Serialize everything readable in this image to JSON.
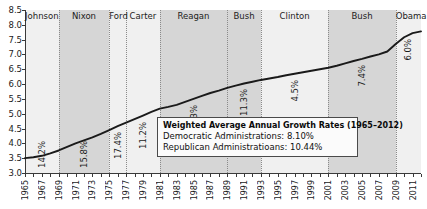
{
  "chart_data": {
    "type": "line",
    "title": "",
    "xlabel": "",
    "ylabel": "",
    "xlim": [
      1965,
      2012
    ],
    "ylim": [
      3.0,
      8.5
    ],
    "grid": false,
    "legend_position": "inside-center-right",
    "y_ticks": [
      "8.5",
      "8.0",
      "7.5",
      "7.0",
      "6.5",
      "6.0",
      "5.5",
      "5.0",
      "4.5",
      "4.0",
      "3.5",
      "3.0"
    ],
    "x_ticks": [
      "1965",
      "1967",
      "1969",
      "1971",
      "1973",
      "1975",
      "1977",
      "1979",
      "1981",
      "1983",
      "1985",
      "1987",
      "1989",
      "1991",
      "1993",
      "1995",
      "1997",
      "1999",
      "2001",
      "2003",
      "2005",
      "2007",
      "2009",
      "2011"
    ],
    "x": [
      1965,
      1966,
      1967,
      1968,
      1969,
      1970,
      1971,
      1972,
      1973,
      1974,
      1975,
      1976,
      1977,
      1978,
      1979,
      1980,
      1981,
      1982,
      1983,
      1984,
      1985,
      1986,
      1987,
      1988,
      1989,
      1990,
      1991,
      1992,
      1993,
      1994,
      1995,
      1996,
      1997,
      1998,
      1999,
      2000,
      2001,
      2002,
      2003,
      2004,
      2005,
      2006,
      2007,
      2008,
      2009,
      2010,
      2011,
      2012
    ],
    "values": [
      3.5,
      3.53,
      3.58,
      3.66,
      3.76,
      3.88,
      4.0,
      4.1,
      4.2,
      4.32,
      4.45,
      4.58,
      4.7,
      4.82,
      4.94,
      5.06,
      5.17,
      5.23,
      5.3,
      5.4,
      5.5,
      5.6,
      5.7,
      5.78,
      5.87,
      5.95,
      6.02,
      6.08,
      6.14,
      6.19,
      6.24,
      6.3,
      6.35,
      6.4,
      6.45,
      6.5,
      6.55,
      6.62,
      6.7,
      6.78,
      6.85,
      6.93,
      7.0,
      7.1,
      7.35,
      7.58,
      7.72,
      7.78
    ],
    "series_name": "Cumulative debt (log scale)",
    "eras": [
      {
        "name": "Johnson",
        "start": 1965,
        "end": 1969,
        "shade": "light",
        "rate": "14.2%"
      },
      {
        "name": "Nixon",
        "start": 1969,
        "end": 1975,
        "shade": "dark",
        "rate": "15.8%"
      },
      {
        "name": "Ford",
        "start": 1975,
        "end": 1977,
        "shade": "light",
        "rate": "17.4%"
      },
      {
        "name": "Carter",
        "start": 1977,
        "end": 1981,
        "shade": "light",
        "rate": "11.2%"
      },
      {
        "name": "Reagan",
        "start": 1981,
        "end": 1989,
        "shade": "dark",
        "rate": "7.3%"
      },
      {
        "name": "Bush",
        "start": 1989,
        "end": 1993,
        "shade": "dark",
        "rate": "11.3%"
      },
      {
        "name": "Clinton",
        "start": 1993,
        "end": 2001,
        "shade": "light",
        "rate": "4.5%"
      },
      {
        "name": "Bush",
        "start": 2001,
        "end": 2009,
        "shade": "dark",
        "rate": "7.4%"
      },
      {
        "name": "Obama",
        "start": 2009,
        "end": 2012,
        "shade": "light",
        "rate": "6.0%"
      }
    ],
    "annotation": {
      "title": "Weighted Average Annual Growth Rates (1965–2012)",
      "rows": [
        "Democratic Administrations: 8.10%",
        "Republican Administratioans: 10.44%"
      ]
    },
    "colors": {
      "line": "#1a1a1a",
      "band_light": "#f0f0f0",
      "band_dark": "#d6d6d6",
      "axis": "#3a3a3a",
      "divider": "#8a8a8a",
      "legend_bg": "#fbfbfb",
      "legend_border": "#4a4a4a"
    }
  }
}
